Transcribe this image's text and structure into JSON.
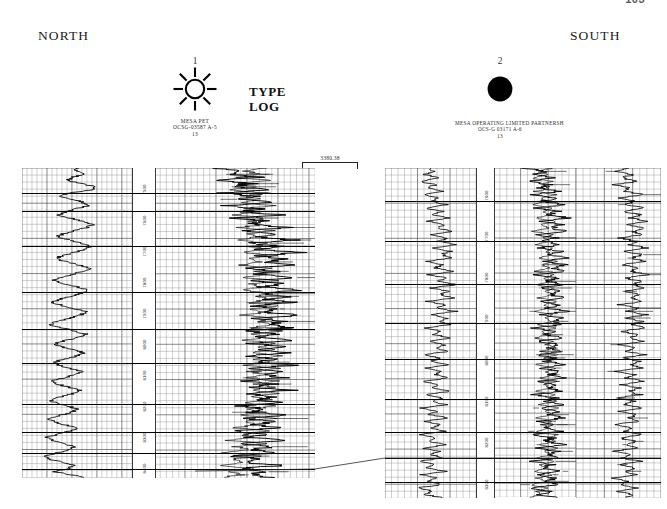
{
  "document": {
    "page_number": "103",
    "title_line_1": "TYPE",
    "title_line_2": "LOG",
    "direction_left": "NORTH",
    "direction_right": "SOUTH"
  },
  "scales": {
    "horizontal": {
      "label": "3380.38",
      "unit_implied": "feet"
    },
    "vertical": {
      "label": "200 Feet"
    }
  },
  "wells": [
    {
      "number": "1",
      "symbol": "sun-symbol",
      "operator": "MESA PET",
      "lease": "OCSG-03587 A-5",
      "block": "13",
      "depth_labels": [
        "7500",
        "7600",
        "7700",
        "7800",
        "7900",
        "8000",
        "8100",
        "8200",
        "8300",
        "8400"
      ]
    },
    {
      "number": "2",
      "symbol": "filled-circle-symbol",
      "operator": "MESA OPERATING  LIMITED  PARTNERSH",
      "lease": "OCS-G 03171 A-6",
      "block": "13",
      "depth_labels": [
        "7600",
        "7700",
        "7800",
        "7900",
        "8000",
        "8100",
        "8200",
        "8300"
      ]
    }
  ],
  "chart_data": {
    "type": "line",
    "xlabel": "",
    "ylabel": "Depth (feet)",
    "grid": true,
    "legend": "none",
    "panels": [
      {
        "well": "1",
        "operator": "MESA PET",
        "lease": "OCSG-03587 A-5",
        "depth_range": [
          7450,
          8500
        ],
        "tracks": [
          {
            "name": "sp-gamma-track",
            "curve": "SP / Gamma Ray",
            "values": [
              52,
              48,
              60,
              44,
              38,
              55,
              72,
              66,
              40,
              30,
              45,
              58,
              64,
              50,
              36,
              28,
              42,
              56,
              70,
              62,
              48,
              34,
              26,
              40,
              54,
              68,
              60,
              46,
              32,
              24,
              38,
              52,
              66,
              58,
              44,
              30,
              22,
              36,
              50,
              64,
              56,
              42,
              28,
              20,
              34,
              48,
              62,
              54,
              40,
              26,
              18,
              32,
              46,
              60,
              52,
              38,
              24,
              30,
              44,
              58,
              50,
              36,
              22,
              28,
              42,
              56,
              48,
              34,
              20,
              26,
              40,
              54,
              46,
              32,
              18,
              24,
              38,
              52,
              44,
              30,
              16,
              22,
              36,
              50,
              42,
              28,
              14,
              20,
              34,
              48,
              40,
              26,
              12,
              18,
              32,
              46,
              38,
              24,
              44,
              58
            ]
          },
          {
            "name": "resistivity-track",
            "curve": "Resistivity (deep / shallow)",
            "values": [
              30,
              58,
              44,
              70,
              35,
              62,
              48,
              76,
              40,
              66,
              52,
              80,
              45,
              70,
              56,
              84,
              50,
              74,
              60,
              88,
              55,
              78,
              64,
              92,
              60,
              82,
              68,
              96,
              65,
              86,
              72,
              90,
              58,
              80,
              66,
              94,
              62,
              84,
              70,
              98,
              66,
              88,
              74,
              92,
              60,
              82,
              68,
              96,
              64,
              86,
              72,
              90,
              58,
              80,
              66,
              94,
              62,
              84,
              70,
              88,
              56,
              78,
              64,
              92,
              60,
              82,
              68,
              86,
              54,
              76,
              62,
              90,
              58,
              80,
              66,
              84,
              52,
              74,
              60,
              88,
              56,
              78,
              64,
              82,
              50,
              72,
              58,
              86,
              54,
              76,
              62,
              80,
              48,
              70,
              56,
              84,
              52,
              74,
              60,
              78
            ]
          }
        ],
        "marker_horizons": [
          0.08,
          0.14,
          0.25,
          0.4,
          0.52,
          0.63,
          0.76,
          0.85,
          0.92,
          0.97
        ]
      },
      {
        "well": "2",
        "operator": "MESA OPERATING LIMITED PARTNERSH",
        "lease": "OCS-G 03171 A-6",
        "depth_range": [
          7500,
          8600
        ],
        "tracks": [
          {
            "name": "sp-gamma-track",
            "curve": "SP / Gamma Ray",
            "values": [
              48,
              56,
              40,
              64,
              34,
              58,
              46,
              70,
              38,
              62,
              50,
              74,
              42,
              66,
              54,
              78,
              46,
              70,
              58,
              82,
              50,
              74,
              62,
              86,
              54,
              78,
              66,
              80,
              44,
              68,
              56,
              84,
              48,
              72,
              60,
              88,
              52,
              76,
              64,
              82,
              46,
              70,
              58,
              86,
              50,
              74,
              62,
              78,
              42,
              66,
              54,
              82,
              46,
              70,
              58,
              76,
              40,
              64,
              52,
              80,
              44,
              68,
              56,
              74,
              38,
              62,
              50,
              78,
              42,
              66,
              54,
              72,
              36,
              60,
              48,
              76,
              40,
              64,
              52,
              70,
              34,
              58,
              46,
              74,
              38,
              62,
              50,
              68,
              32,
              56,
              44,
              72,
              36,
              60,
              48,
              66,
              30,
              54,
              42,
              70
            ]
          },
          {
            "name": "resistivity-track",
            "curve": "Resistivity (deep / shallow)",
            "values": [
              36,
              64,
              50,
              78,
              42,
              70,
              56,
              84,
              48,
              76,
              62,
              90,
              54,
              82,
              68,
              96,
              60,
              88,
              74,
              92,
              50,
              78,
              64,
              86,
              56,
              84,
              70,
              94,
              62,
              90,
              76,
              88,
              52,
              80,
              66,
              92,
              58,
              86,
              72,
              90,
              54,
              82,
              68,
              94,
              60,
              88,
              74,
              86,
              50,
              78,
              64,
              92,
              56,
              84,
              70,
              88,
              52,
              80,
              66,
              94,
              58,
              86,
              72,
              90,
              54,
              82,
              68,
              86,
              50,
              78,
              64,
              92,
              56,
              84,
              70,
              88,
              52,
              80,
              66,
              86,
              48,
              76,
              62,
              90,
              54,
              82,
              68,
              84,
              46,
              74,
              60,
              88,
              52,
              80,
              66,
              82,
              44,
              72,
              58,
              86
            ]
          },
          {
            "name": "porosity-track",
            "curve": "Porosity / Density",
            "values": [
              62,
              48,
              70,
              54,
              80,
              44,
              66,
              58,
              86,
              50,
              74,
              62,
              90,
              56,
              82,
              68,
              94,
              60,
              88,
              72,
              84,
              52,
              78,
              64,
              92,
              58,
              86,
              70,
              88,
              54,
              80,
              66,
              94,
              60,
              84,
              72,
              90,
              56,
              82,
              68,
              86,
              52,
              78,
              64,
              92,
              58,
              84,
              70,
              88,
              54,
              80,
              66,
              86,
              50,
              76,
              62,
              90,
              56,
              82,
              68,
              84,
              48,
              74,
              60,
              88,
              54,
              80,
              66,
              82,
              46,
              72,
              58,
              86,
              52,
              78,
              64,
              80,
              44,
              70,
              56,
              84,
              50,
              76,
              62,
              78,
              42,
              68,
              54,
              82,
              48,
              74,
              60,
              76,
              40,
              66,
              52,
              80,
              46,
              72,
              58
            ]
          }
        ],
        "marker_horizons": [
          0.1,
          0.22,
          0.35,
          0.47,
          0.58,
          0.7,
          0.8,
          0.88,
          0.95
        ]
      }
    ],
    "correlation_lines": [
      {
        "name": "lower-tie-line",
        "from_x": 315,
        "from_y": 469,
        "to_x": 385,
        "to_y": 458
      }
    ]
  },
  "colors": {
    "ink": "#000000",
    "paper": "#ffffff",
    "grid": "#7a7a7a",
    "muted_text": "#3a3a3a"
  }
}
